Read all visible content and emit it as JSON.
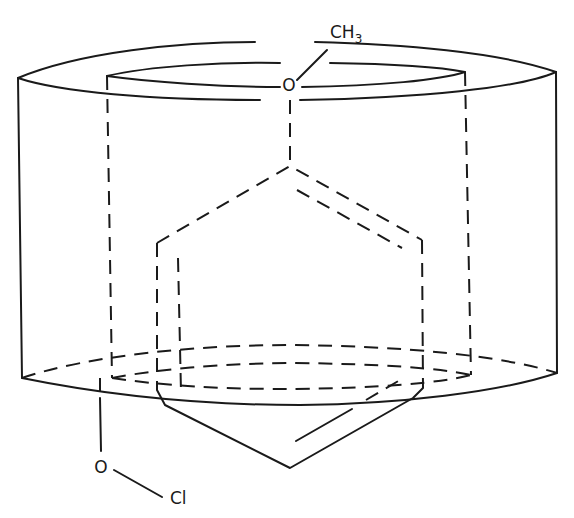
{
  "diagram": {
    "labels": {
      "top_group_main": "CH",
      "top_group_sub": "3",
      "top_oxygen": "O",
      "bottom_oxygen": "O",
      "bottom_chlorine": "Cl"
    },
    "colors": {
      "line": "#1a1a1a",
      "background": "#ffffff"
    }
  }
}
